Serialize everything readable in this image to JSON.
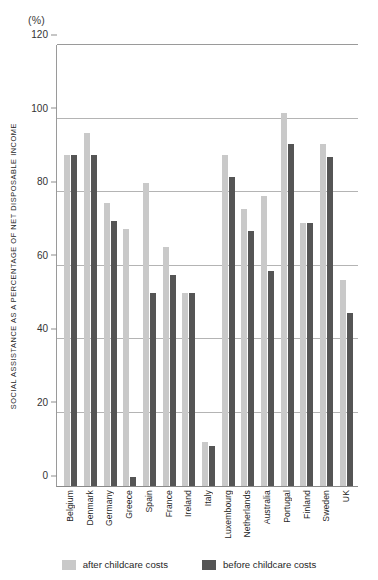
{
  "unit_label": "(%)",
  "y_axis_title": "SOCIAL ASSISTANCE AS A PERCENTAGE OF NET DISPOSABLE INCOME",
  "legend": {
    "after": "after childcare costs",
    "before": "before childcare costs"
  },
  "colors": {
    "after": "#c9c9c9",
    "before": "#555555",
    "gridline": "#b4b4b4",
    "axis": "#8a8a8a"
  },
  "chart_data": {
    "type": "bar",
    "title": "",
    "xlabel": "",
    "ylabel": "SOCIAL ASSISTANCE AS A PERCENTAGE OF NET DISPOSABLE INCOME",
    "unit": "(%)",
    "ylim": [
      0,
      120
    ],
    "yticks": [
      0,
      20,
      40,
      60,
      80,
      100,
      120
    ],
    "grid": true,
    "legend_position": "bottom",
    "categories": [
      "Belgium",
      "Denmark",
      "Germany",
      "Greece",
      "Spain",
      "France",
      "Ireland",
      "Italy",
      "Luxembourg",
      "Netherlands",
      "Australia",
      "Portugal",
      "Finland",
      "Sweden",
      "UK"
    ],
    "series": [
      {
        "name": "after childcare costs",
        "color": "#c9c9c9",
        "values": [
          90,
          96,
          77,
          70,
          82.5,
          65,
          52.5,
          12,
          90,
          75.5,
          79,
          101.5,
          71.5,
          93,
          56
        ]
      },
      {
        "name": "before childcare costs",
        "color": "#555555",
        "values": [
          90,
          90,
          72,
          2.5,
          52.5,
          57.5,
          52.5,
          11,
          84,
          69.5,
          58.5,
          93,
          71.5,
          89.5,
          47
        ]
      }
    ]
  }
}
